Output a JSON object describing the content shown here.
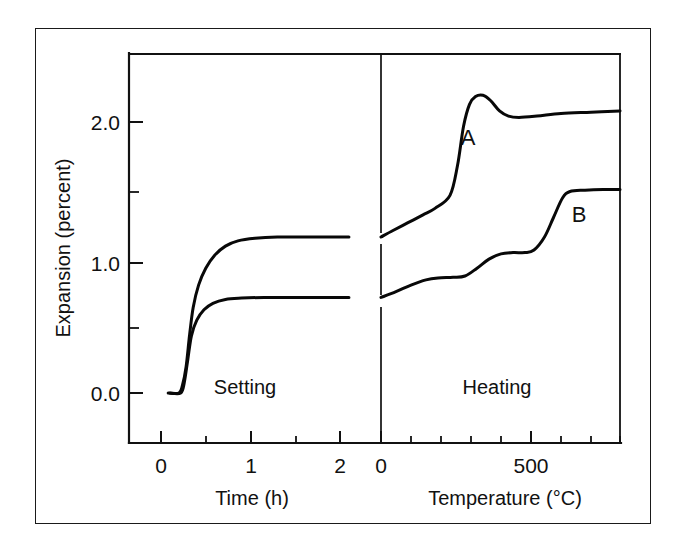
{
  "figure": {
    "background_color": "#ffffff",
    "line_color": "#111111",
    "frame_color": "#1a1a1a"
  },
  "chart_data": {
    "type": "line",
    "title": "",
    "subtitle": "",
    "ylabel": "Expansion (percent)",
    "ylim": [
      -0.35,
      2.45
    ],
    "yticks": [
      0.0,
      1.0,
      2.0
    ],
    "ytick_labels": [
      "0.0",
      "1.0",
      "2.0"
    ],
    "yminor_ticks": [
      0.5,
      1.5
    ],
    "grid": false,
    "legend_position": "inline-annotations",
    "panels": [
      {
        "name": "setting",
        "label": "Setting",
        "xlabel": "Time (h)",
        "xlim": [
          -0.12,
          2.1
        ],
        "xticks": [
          0,
          1,
          2
        ],
        "xtick_labels": [
          "0",
          "1",
          "2"
        ],
        "xminor_ticks": [
          0.5,
          1.5
        ],
        "series": [
          {
            "name": "A",
            "points": [
              [
                0.08,
                0.0
              ],
              [
                0.2,
                0.0
              ],
              [
                0.24,
                0.06
              ],
              [
                0.28,
                0.2
              ],
              [
                0.32,
                0.45
              ],
              [
                0.36,
                0.66
              ],
              [
                0.42,
                0.83
              ],
              [
                0.5,
                0.96
              ],
              [
                0.6,
                1.06
              ],
              [
                0.72,
                1.13
              ],
              [
                0.86,
                1.17
              ],
              [
                1.05,
                1.19
              ],
              [
                1.3,
                1.2
              ],
              [
                1.6,
                1.2
              ],
              [
                1.9,
                1.2
              ],
              [
                2.1,
                1.2
              ]
            ]
          },
          {
            "name": "B",
            "points": [
              [
                0.1,
                0.0
              ],
              [
                0.22,
                0.0
              ],
              [
                0.26,
                0.08
              ],
              [
                0.3,
                0.26
              ],
              [
                0.34,
                0.44
              ],
              [
                0.4,
                0.56
              ],
              [
                0.48,
                0.64
              ],
              [
                0.58,
                0.69
              ],
              [
                0.72,
                0.72
              ],
              [
                0.9,
                0.73
              ],
              [
                1.15,
                0.735
              ],
              [
                1.5,
                0.735
              ],
              [
                1.85,
                0.735
              ],
              [
                2.1,
                0.735
              ]
            ]
          }
        ]
      },
      {
        "name": "heating",
        "label": "Heating",
        "xlabel": "Temperature (°C)",
        "xlim": [
          0,
          800
        ],
        "xticks": [
          0,
          500
        ],
        "xtick_labels": [
          "0",
          "500"
        ],
        "xminor_ticks": [
          100,
          200,
          300,
          400,
          600,
          700,
          800
        ],
        "series": [
          {
            "name": "A",
            "points": [
              [
                0,
                1.2
              ],
              [
                40,
                1.25
              ],
              [
                90,
                1.31
              ],
              [
                140,
                1.37
              ],
              [
                180,
                1.42
              ],
              [
                230,
                1.52
              ],
              [
                255,
                1.75
              ],
              [
                275,
                2.05
              ],
              [
                295,
                2.22
              ],
              [
                315,
                2.28
              ],
              [
                340,
                2.29
              ],
              [
                365,
                2.25
              ],
              [
                395,
                2.17
              ],
              [
                425,
                2.13
              ],
              [
                460,
                2.12
              ],
              [
                520,
                2.13
              ],
              [
                600,
                2.15
              ],
              [
                700,
                2.16
              ],
              [
                800,
                2.17
              ]
            ]
          },
          {
            "name": "B",
            "points": [
              [
                0,
                0.735
              ],
              [
                50,
                0.78
              ],
              [
                100,
                0.83
              ],
              [
                150,
                0.87
              ],
              [
                190,
                0.885
              ],
              [
                240,
                0.89
              ],
              [
                280,
                0.9
              ],
              [
                320,
                0.96
              ],
              [
                360,
                1.03
              ],
              [
                400,
                1.07
              ],
              [
                440,
                1.08
              ],
              [
                480,
                1.08
              ],
              [
                510,
                1.1
              ],
              [
                545,
                1.2
              ],
              [
                575,
                1.35
              ],
              [
                605,
                1.5
              ],
              [
                630,
                1.55
              ],
              [
                680,
                1.56
              ],
              [
                740,
                1.565
              ],
              [
                800,
                1.565
              ]
            ]
          }
        ]
      }
    ],
    "annotations": [
      {
        "text": "A",
        "panel": "heating",
        "x": 280,
        "y": 1.88
      },
      {
        "text": "B",
        "panel": "heating",
        "x": 620,
        "y": 1.43
      }
    ]
  },
  "labels": {
    "ylabel": "Expansion (percent)",
    "ytick_0": "0.0",
    "ytick_1": "1.0",
    "ytick_2": "2.0",
    "setting_region": "Setting",
    "heating_region": "Heating",
    "time_axis_title": "Time (h)",
    "temperature_axis_title": "Temperature (°C)",
    "time_tick_0": "0",
    "time_tick_1": "1",
    "time_tick_2": "2",
    "temp_tick_0": "0",
    "temp_tick_500": "500",
    "curve_a": "A",
    "curve_b": "B"
  }
}
